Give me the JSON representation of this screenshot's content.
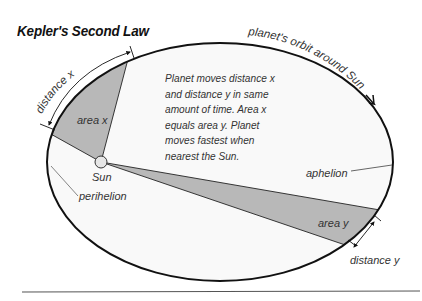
{
  "diagram": {
    "title": "Kepler's Second Law",
    "description_lines": [
      "Planet moves distance x",
      "and distance y in same",
      "amount of time. Area x",
      "equals area y. Planet",
      "moves fastest when",
      "nearest the Sun."
    ],
    "labels": {
      "orbit": "planet's orbit around Sun",
      "distance_x": "distance x",
      "area_x": "area x",
      "sun": "Sun",
      "perihelion": "perihelion",
      "aphelion": "aphelion",
      "area_y": "area y",
      "distance_y": "distance y"
    },
    "colors": {
      "orbit_stroke": "#111111",
      "orbit_fill": "#f9f9f9",
      "wedge_fill": "#b8b8b8",
      "sun_fill": "#e6e6e6",
      "rule": "#555555",
      "text": "#333333"
    }
  }
}
